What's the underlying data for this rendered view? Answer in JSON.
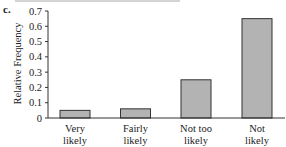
{
  "panel_label": "c.",
  "chart_data": {
    "type": "bar",
    "title": "",
    "xlabel": "",
    "ylabel": "Relative Frequency",
    "categories": [
      "Very likely",
      "Fairly likely",
      "Not too likely",
      "Not likely"
    ],
    "category_lines": [
      [
        "Very",
        "likely"
      ],
      [
        "Fairly",
        "likely"
      ],
      [
        "Not too",
        "likely"
      ],
      [
        "Not",
        "likely"
      ]
    ],
    "values": [
      0.05,
      0.06,
      0.25,
      0.65
    ],
    "ylim": [
      0,
      0.7
    ],
    "yticks": [
      "0",
      "0.1",
      "0.2",
      "0.3",
      "0.4",
      "0.5",
      "0.6",
      "0.7"
    ],
    "grid": false,
    "legend": null
  },
  "colors": {
    "bar_fill": "#b3b3b3",
    "bar_stroke": "#333333",
    "axis": "#333333"
  }
}
